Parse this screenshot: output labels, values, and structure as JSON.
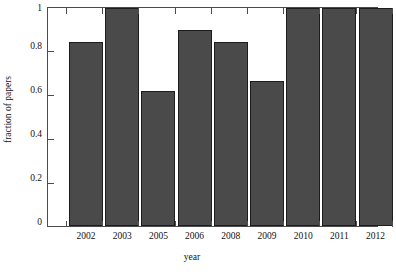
{
  "chart_data": {
    "type": "bar",
    "title": "",
    "xlabel": "year",
    "ylabel": "fraction of papers",
    "categories": [
      "2002",
      "2003",
      "2005",
      "2006",
      "2008",
      "2009",
      "2010",
      "2011",
      "2012"
    ],
    "values": [
      0.845,
      1.0,
      0.62,
      0.9,
      0.845,
      0.665,
      1.0,
      1.0,
      1.0
    ],
    "ylim": [
      0,
      1
    ],
    "yticks": [
      0,
      0.2,
      0.4,
      0.6,
      0.8,
      1
    ],
    "ytick_labels": [
      "0",
      "0.2",
      "0.4",
      "0.6",
      "0.8",
      "1"
    ],
    "grid": false,
    "legend": "none",
    "bar_color": "#4a4a4a",
    "bar_edge_color": "#1c1c1c",
    "axis_color": "#4c4c4c",
    "background": "#ffffff",
    "ticks_all_sides": true
  }
}
